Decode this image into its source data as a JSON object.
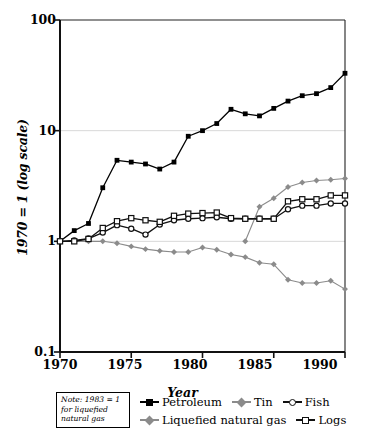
{
  "chart_data": {
    "type": "line",
    "title": "",
    "xlabel": "Year",
    "ylabel": "1970 = 1 (log scale)",
    "yscale": "log",
    "ylim": [
      0.1,
      100
    ],
    "xlim": [
      1970,
      1990
    ],
    "yticks": [
      "0.1",
      "1",
      "10",
      "100"
    ],
    "ytick_values": [
      0.1,
      1,
      10,
      100
    ],
    "xticks": [
      "1970",
      "1975",
      "1980",
      "1985",
      "1990"
    ],
    "xtick_values": [
      1970,
      1975,
      1980,
      1985,
      1990
    ],
    "grid": "horizontal-faint",
    "legend_position": "below-right",
    "note": "Note: 1983 = 1 for liquefied natural gas",
    "x": [
      1970,
      1971,
      1972,
      1973,
      1974,
      1975,
      1976,
      1977,
      1978,
      1979,
      1980,
      1981,
      1982,
      1983,
      1984,
      1985,
      1986,
      1987,
      1988,
      1989,
      1990
    ],
    "series": [
      {
        "name": "Petroleum",
        "color": "#000000",
        "marker": "filled-square",
        "values": [
          1.0,
          1.25,
          1.45,
          3.05,
          5.4,
          5.2,
          5.0,
          4.5,
          5.2,
          8.9,
          10.0,
          11.6,
          15.6,
          14.2,
          13.6,
          15.9,
          18.5,
          20.7,
          21.6,
          24.5,
          33.0
        ]
      },
      {
        "name": "Tin",
        "color": "#8b8b8b",
        "marker": "diamond",
        "values": [
          1.0,
          1.0,
          1.0,
          1.0,
          0.96,
          0.9,
          0.85,
          0.82,
          0.8,
          0.8,
          0.88,
          0.84,
          0.76,
          0.72,
          0.64,
          0.62,
          0.45,
          0.42,
          0.42,
          0.44,
          0.37
        ]
      },
      {
        "name": "Fish",
        "color": "#111111",
        "marker": "open-circle",
        "values": [
          1.0,
          1.02,
          1.06,
          1.2,
          1.4,
          1.3,
          1.15,
          1.42,
          1.55,
          1.6,
          1.62,
          1.65,
          1.6,
          1.6,
          1.6,
          1.6,
          1.95,
          2.1,
          2.1,
          2.2,
          2.2
        ]
      },
      {
        "name": "Liquefied natural gas",
        "color": "#8b8b8b",
        "marker": "diamond",
        "values": [
          null,
          null,
          null,
          null,
          null,
          null,
          null,
          null,
          null,
          null,
          null,
          null,
          null,
          1.0,
          2.05,
          2.45,
          3.1,
          3.4,
          3.55,
          3.6,
          3.7
        ]
      },
      {
        "name": "Logs",
        "color": "#111111",
        "marker": "open-square",
        "values": [
          1.0,
          1.0,
          1.05,
          1.32,
          1.52,
          1.62,
          1.55,
          1.5,
          1.7,
          1.78,
          1.8,
          1.82,
          1.62,
          1.6,
          1.6,
          1.6,
          2.3,
          2.4,
          2.4,
          2.6,
          2.6
        ]
      }
    ]
  },
  "legend": {
    "rows": [
      [
        {
          "label": "Petroleum",
          "marker": "filled-square",
          "color": "#000000"
        },
        {
          "label": "Tin",
          "marker": "diamond",
          "color": "#8b8b8b"
        },
        {
          "label": "Fish",
          "marker": "open-circle",
          "color": "#111111"
        }
      ],
      [
        {
          "label": "Liquefied natural gas",
          "marker": "diamond",
          "color": "#8b8b8b"
        },
        {
          "label": "Logs",
          "marker": "open-square",
          "color": "#111111"
        }
      ]
    ]
  }
}
